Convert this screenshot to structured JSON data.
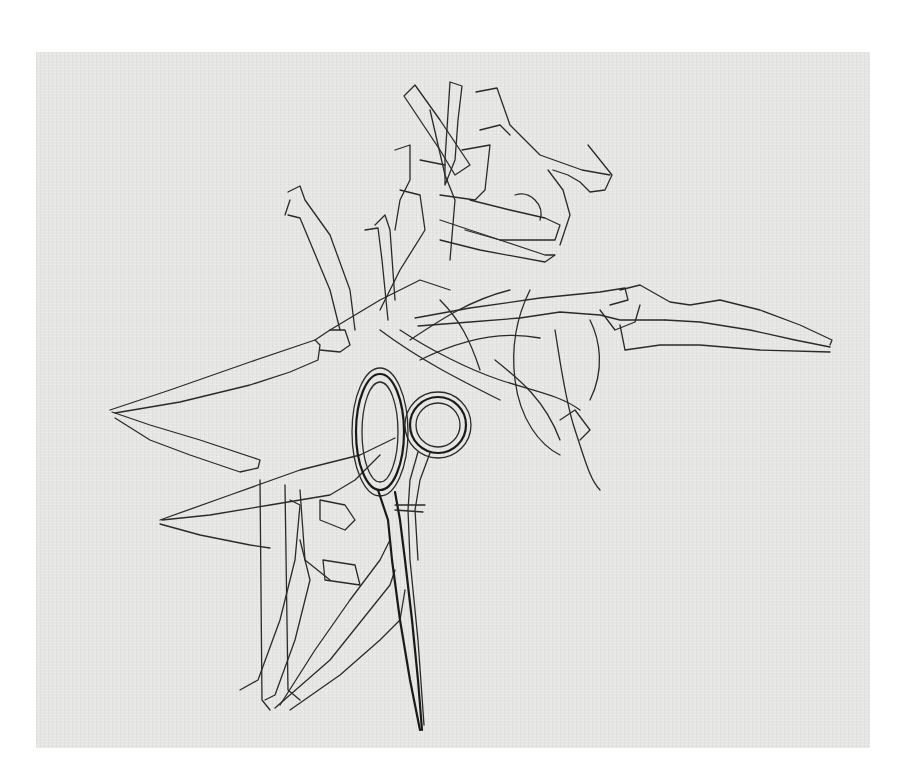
{
  "artwork": {
    "subject": "Line drawing of scissors surrounded by overlapping outlines of open scissor blades and torn tape strips",
    "medium": "pen line drawing on textured gray paper",
    "colors": {
      "background": "#ffffff",
      "paper": "#e6e6e4",
      "ink": "#2a2a2a"
    },
    "elements": [
      {
        "name": "closed-scissors",
        "description": "Central closed pair of scissors pointing downward"
      },
      {
        "name": "open-blades-left-upper",
        "description": "Open blades pointing left, upper"
      },
      {
        "name": "open-blades-left-lower",
        "description": "Open blades pointing left, lower"
      },
      {
        "name": "open-blades-right",
        "description": "Open blades pointing right"
      },
      {
        "name": "blades-bottom-fan",
        "description": "Fan of blades pointing down-left"
      },
      {
        "name": "tape-strips",
        "description": "Scattered torn tape strip outlines at top"
      }
    ]
  }
}
